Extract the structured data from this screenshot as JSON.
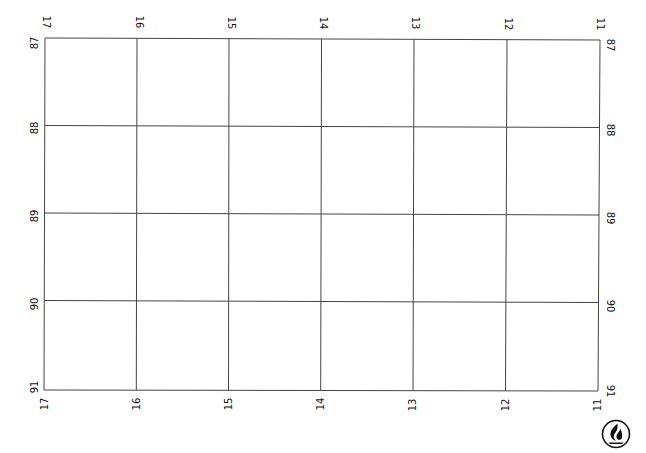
{
  "map": {
    "type": "blank coordinate grid sheet",
    "colors": {
      "background": "#ffffff",
      "grid_line": "#444444",
      "label": "#111111",
      "logo": "#111111"
    },
    "columns": {
      "top_labels": [
        "17",
        "16",
        "15",
        "14",
        "13",
        "12",
        "11"
      ],
      "bottom_labels": [
        "17",
        "16",
        "15",
        "14",
        "13",
        "12",
        "11"
      ]
    },
    "rows": {
      "left_labels": [
        "87",
        "88",
        "89",
        "90",
        "91"
      ],
      "right_labels": [
        "87",
        "88",
        "89",
        "90",
        "91"
      ]
    },
    "logo": {
      "icon": "flame-logo-icon"
    }
  }
}
